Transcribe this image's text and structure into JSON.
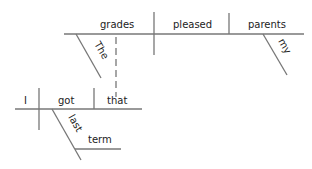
{
  "diagram": {
    "type": "sentence diagram",
    "main_clause": {
      "subject": "grades",
      "verb": "pleased",
      "object": "parents",
      "modifiers": {
        "subject_modifier": "The",
        "object_modifier": "my"
      }
    },
    "relative_clause": {
      "subject": "I",
      "verb": "got",
      "object": "that",
      "modifiers": {
        "verb_modifier": "last",
        "adverbial_object": "term"
      }
    }
  },
  "colors": {
    "line": "#777777",
    "text": "#222222",
    "background": "#ffffff"
  }
}
